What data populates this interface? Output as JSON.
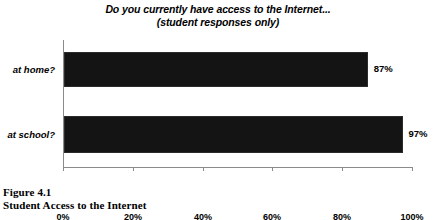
{
  "chart_data": {
    "type": "bar",
    "orientation": "horizontal",
    "title": "Do you currently have access to the Internet...",
    "subtitle": "(student responses only)",
    "categories": [
      "at home?",
      "at school?"
    ],
    "values": [
      87,
      97
    ],
    "value_labels": [
      "87%",
      "97%"
    ],
    "xlabel": "",
    "ylabel": "",
    "xlim": [
      0,
      100
    ],
    "xticks": [
      0,
      20,
      40,
      60,
      80,
      100
    ],
    "xtick_labels": [
      "0%",
      "20%",
      "40%",
      "60%",
      "80%",
      "100%"
    ],
    "grid": false,
    "legend": false,
    "bar_color": "#141414",
    "axis_color": "#8a8a8a"
  },
  "caption": {
    "number": "Figure 4.1",
    "text": "Student Access to the Internet"
  }
}
